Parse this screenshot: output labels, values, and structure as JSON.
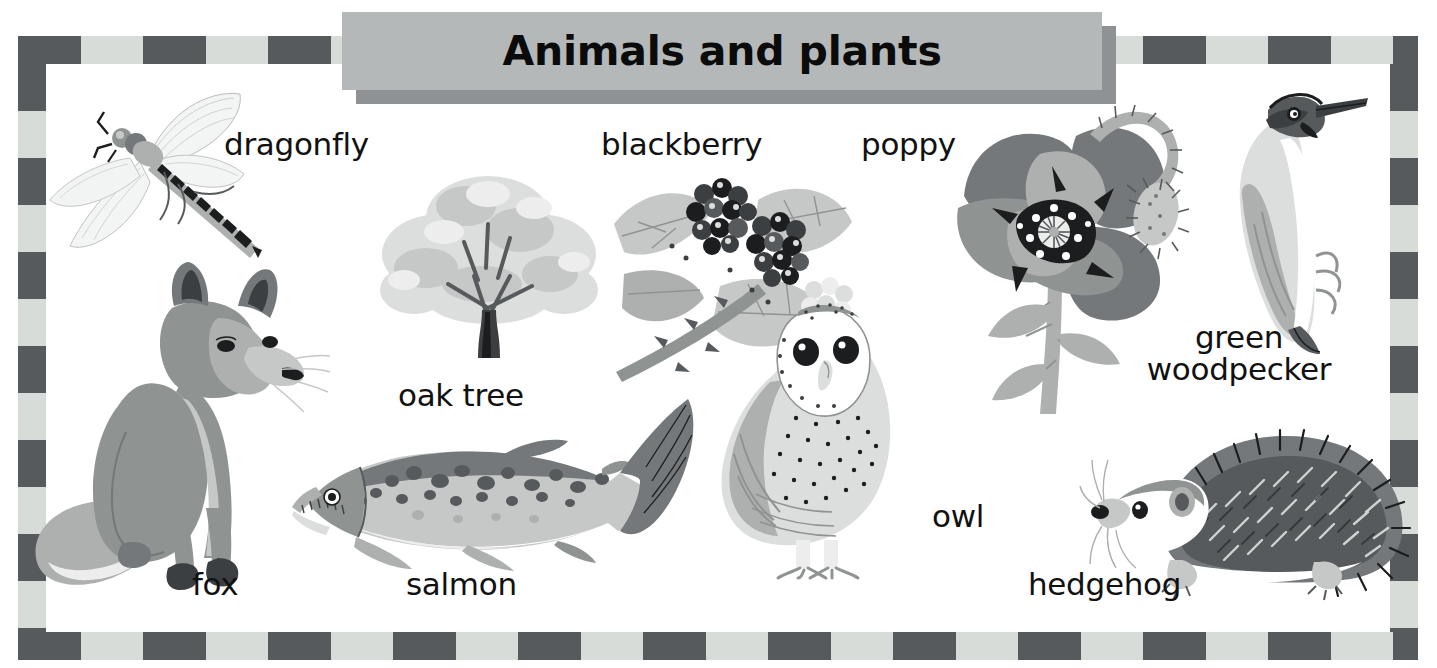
{
  "page": {
    "title": "Animals and plants",
    "kind": "illustrated-vocabulary-poster"
  },
  "colors": {
    "border_dark": "#565a5c",
    "border_light": "#d8dcd9",
    "banner_fill": "#b5b8b9",
    "banner_shadow": "#8f9295",
    "text": "#111111",
    "page_background": "#ffffff"
  },
  "banner": {
    "heading": "Animals and plants"
  },
  "labels": {
    "dragonfly": "dragonfly",
    "oak_tree": "oak tree",
    "blackberry": "blackberry",
    "poppy": "poppy",
    "green_woodpecker_line1": "green",
    "green_woodpecker_line2": "woodpecker",
    "fox": "fox",
    "salmon": "salmon",
    "owl": "owl",
    "hedgehog": "hedgehog"
  },
  "illustrations": [
    {
      "name": "dragonfly-illustration",
      "label": "dragonfly"
    },
    {
      "name": "oak-tree-illustration",
      "label": "oak tree"
    },
    {
      "name": "blackberry-illustration",
      "label": "blackberry"
    },
    {
      "name": "poppy-illustration",
      "label": "poppy"
    },
    {
      "name": "green-woodpecker-illustration",
      "label": "green woodpecker"
    },
    {
      "name": "fox-illustration",
      "label": "fox"
    },
    {
      "name": "salmon-illustration",
      "label": "salmon"
    },
    {
      "name": "owl-illustration",
      "label": "owl"
    },
    {
      "name": "hedgehog-illustration",
      "label": "hedgehog"
    }
  ]
}
